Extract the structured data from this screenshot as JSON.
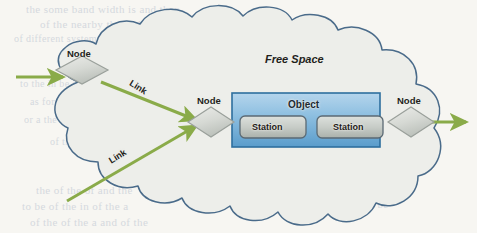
{
  "page": {
    "width": 477,
    "height": 233,
    "background_color": "#f7f6f2",
    "kind": "scanned-book-figure"
  },
  "figure": {
    "cloud": {
      "label": "Free Space",
      "outline_color": "#4a6b8a",
      "fill_color": "#edeeea"
    },
    "nodes": [
      {
        "id": "node-left",
        "label": "Node",
        "shape": "diamond",
        "cx": 82,
        "cy": 70
      },
      {
        "id": "node-mid",
        "label": "Node",
        "shape": "diamond",
        "cx": 211,
        "cy": 122
      },
      {
        "id": "node-right",
        "label": "Node",
        "shape": "diamond",
        "cx": 411,
        "cy": 121
      }
    ],
    "links": [
      {
        "id": "link-top",
        "label": "Link"
      },
      {
        "id": "link-bottom",
        "label": "Link"
      }
    ],
    "object": {
      "label": "Object",
      "fill_top": "#a9cde8",
      "fill_bottom": "#5d9fcd",
      "border_color": "#2e6f9e",
      "stations": [
        {
          "id": "station-1",
          "label": "Station"
        },
        {
          "id": "station-2",
          "label": "Station"
        }
      ]
    },
    "colors": {
      "arrow_green": "#8aab49",
      "cloud_outline": "#4a6b8a",
      "diamond_fill_light": "#e8eae6",
      "diamond_fill_dark": "#c3c7c1",
      "diamond_border": "#9aa09b",
      "station_fill_top": "#d8dcd8",
      "station_fill_bottom": "#b4bab4",
      "station_border": "#5b6a74"
    }
  },
  "bleed_text": {
    "lines": [
      {
        "text": "the some band width is and then",
        "x": 26,
        "y": 3,
        "size": 11
      },
      {
        "text": "of the nearby the and",
        "x": 40,
        "y": 18,
        "size": 11
      },
      {
        "text": "of different systems can be the",
        "x": 14,
        "y": 33,
        "size": 10
      },
      {
        "text": "the of the environment be",
        "x": 196,
        "y": 34,
        "size": 10
      },
      {
        "text": "al Link Propa",
        "x": 262,
        "y": 62,
        "size": 12
      },
      {
        "text": "to the in be in of the",
        "x": 20,
        "y": 78,
        "size": 10
      },
      {
        "text": "in the free space of a the",
        "x": 196,
        "y": 80,
        "size": 10
      },
      {
        "text": "as for the that the of",
        "x": 30,
        "y": 96,
        "size": 10
      },
      {
        "text": "and the capability of",
        "x": 206,
        "y": 100,
        "size": 10
      },
      {
        "text": "or a the of the of",
        "x": 24,
        "y": 114,
        "size": 10
      },
      {
        "text": "of the to be the",
        "x": 50,
        "y": 136,
        "size": 10
      },
      {
        "text": "so the of a and in the",
        "x": 120,
        "y": 152,
        "size": 10
      },
      {
        "text": "can be of the in",
        "x": 210,
        "y": 168,
        "size": 10
      },
      {
        "text": "the of the of and the",
        "x": 36,
        "y": 184,
        "size": 11
      },
      {
        "text": "to be of the in of the a",
        "x": 22,
        "y": 200,
        "size": 11
      },
      {
        "text": "the of and the to be",
        "x": 296,
        "y": 198,
        "size": 11
      },
      {
        "text": "of the of the a and of the",
        "x": 30,
        "y": 216,
        "size": 11
      }
    ]
  }
}
